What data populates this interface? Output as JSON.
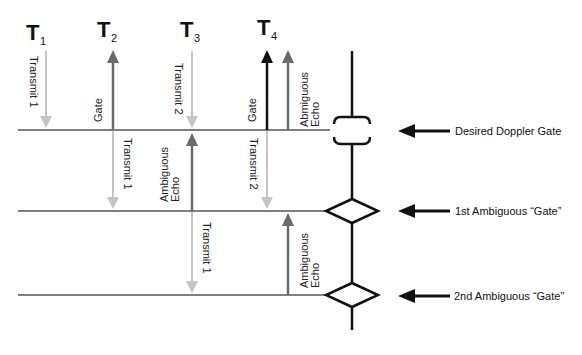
{
  "time_labels": [
    {
      "main": "T",
      "sub": "1"
    },
    {
      "main": "T",
      "sub": "2"
    },
    {
      "main": "T",
      "sub": "3"
    },
    {
      "main": "T",
      "sub": "4"
    }
  ],
  "arrow_labels": {
    "t1_row1": "Transmit 1",
    "t2_row1": "Gate",
    "t3_row1": "Transmit 2",
    "t4_row1_gate": "Gate",
    "t4_row1_echo_line1": "Abmiguous",
    "t4_row1_echo_line2": "Echo",
    "t2_row2": "Transmit 1",
    "t3_row2_line1": "Ambiguous",
    "t3_row2_line2": "Echo",
    "t4_row2": "Transmit 2",
    "t3_row3": "Transmit 1",
    "t4_row3_line1": "Ambiguous",
    "t4_row3_line2": "Echo"
  },
  "gate_labels": {
    "desired": "Desired Doppler Gate",
    "first": "1st Ambiguous “Gate”",
    "second": "2nd Ambiguous “Gate”"
  },
  "colors": {
    "transmit": "#c4c4c4",
    "echo": "#6a6a6a",
    "gate": "#111111",
    "line": "#555555"
  }
}
